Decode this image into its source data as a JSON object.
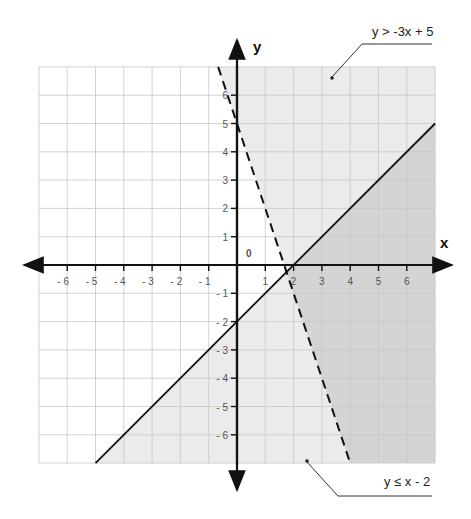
{
  "chart_data": {
    "type": "inequality-graph",
    "title": "",
    "xlabel": "x",
    "ylabel": "y",
    "xlim": [
      -7,
      7
    ],
    "ylim": [
      -7,
      7
    ],
    "grid": true,
    "origin_label": "0",
    "x_ticks": [
      -6,
      -5,
      -4,
      -3,
      -2,
      -1,
      1,
      2,
      3,
      4,
      5,
      6
    ],
    "y_ticks": [
      -6,
      -5,
      -4,
      -3,
      -2,
      -1,
      1,
      2,
      3,
      4,
      5,
      6
    ],
    "x_tick_labels": [
      "- 6",
      "- 5",
      "- 4",
      "- 3",
      "- 2",
      "- 1",
      "1",
      "2",
      "3",
      "4",
      "5",
      "6"
    ],
    "y_tick_labels": [
      "- 6",
      "- 5",
      "- 4",
      "- 3",
      "- 2",
      "- 1",
      "1",
      "2",
      "3",
      "4",
      "5",
      "6"
    ],
    "series": [
      {
        "name": "y > -3x + 5",
        "boundary": {
          "slope": -3,
          "intercept": 5,
          "style": "dashed"
        },
        "shade": "above",
        "label": "y > -3x + 5"
      },
      {
        "name": "y ≤ x - 2",
        "boundary": {
          "slope": 1,
          "intercept": -2,
          "style": "solid"
        },
        "shade": "below",
        "label": "y ≤ x - 2"
      }
    ],
    "intersection": {
      "x": 1.75,
      "y": -0.25
    },
    "colors": {
      "grid": "#c8c8c8",
      "single_shade": "#ebebeb",
      "overlap_shade": "#d4d4d4",
      "lines": "#111111"
    }
  },
  "labels": {
    "x_axis": "x",
    "y_axis": "y",
    "origin": "0",
    "callout_top": "y > -3x + 5",
    "callout_bottom": "y ≤ x - 2"
  }
}
